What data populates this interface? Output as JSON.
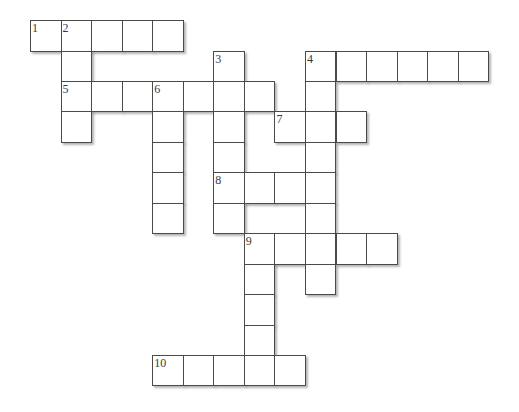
{
  "puzzle": {
    "title": "",
    "entries": [
      {
        "number": "1",
        "direction": "across",
        "row": 0,
        "col": 0,
        "length": 5
      },
      {
        "number": "2",
        "direction": "down",
        "row": 0,
        "col": 1,
        "length": 4
      },
      {
        "number": "3",
        "direction": "down",
        "row": 1,
        "col": 6,
        "length": 6
      },
      {
        "number": "4",
        "direction": "across",
        "row": 1,
        "col": 9,
        "length": 6
      },
      {
        "number": "4",
        "direction": "down",
        "row": 1,
        "col": 9,
        "length": 8
      },
      {
        "number": "5",
        "direction": "across",
        "row": 2,
        "col": 1,
        "length": 7
      },
      {
        "number": "6",
        "direction": "down",
        "row": 2,
        "col": 4,
        "length": 5
      },
      {
        "number": "7",
        "direction": "across",
        "row": 3,
        "col": 8,
        "length": 3
      },
      {
        "number": "8",
        "direction": "across",
        "row": 5,
        "col": 6,
        "length": 4
      },
      {
        "number": "9",
        "direction": "across",
        "row": 7,
        "col": 7,
        "length": 5
      },
      {
        "number": "9",
        "direction": "down",
        "row": 7,
        "col": 7,
        "length": 5
      },
      {
        "number": "10",
        "direction": "across",
        "row": 11,
        "col": 4,
        "length": 5
      }
    ],
    "cell_letters": {}
  }
}
